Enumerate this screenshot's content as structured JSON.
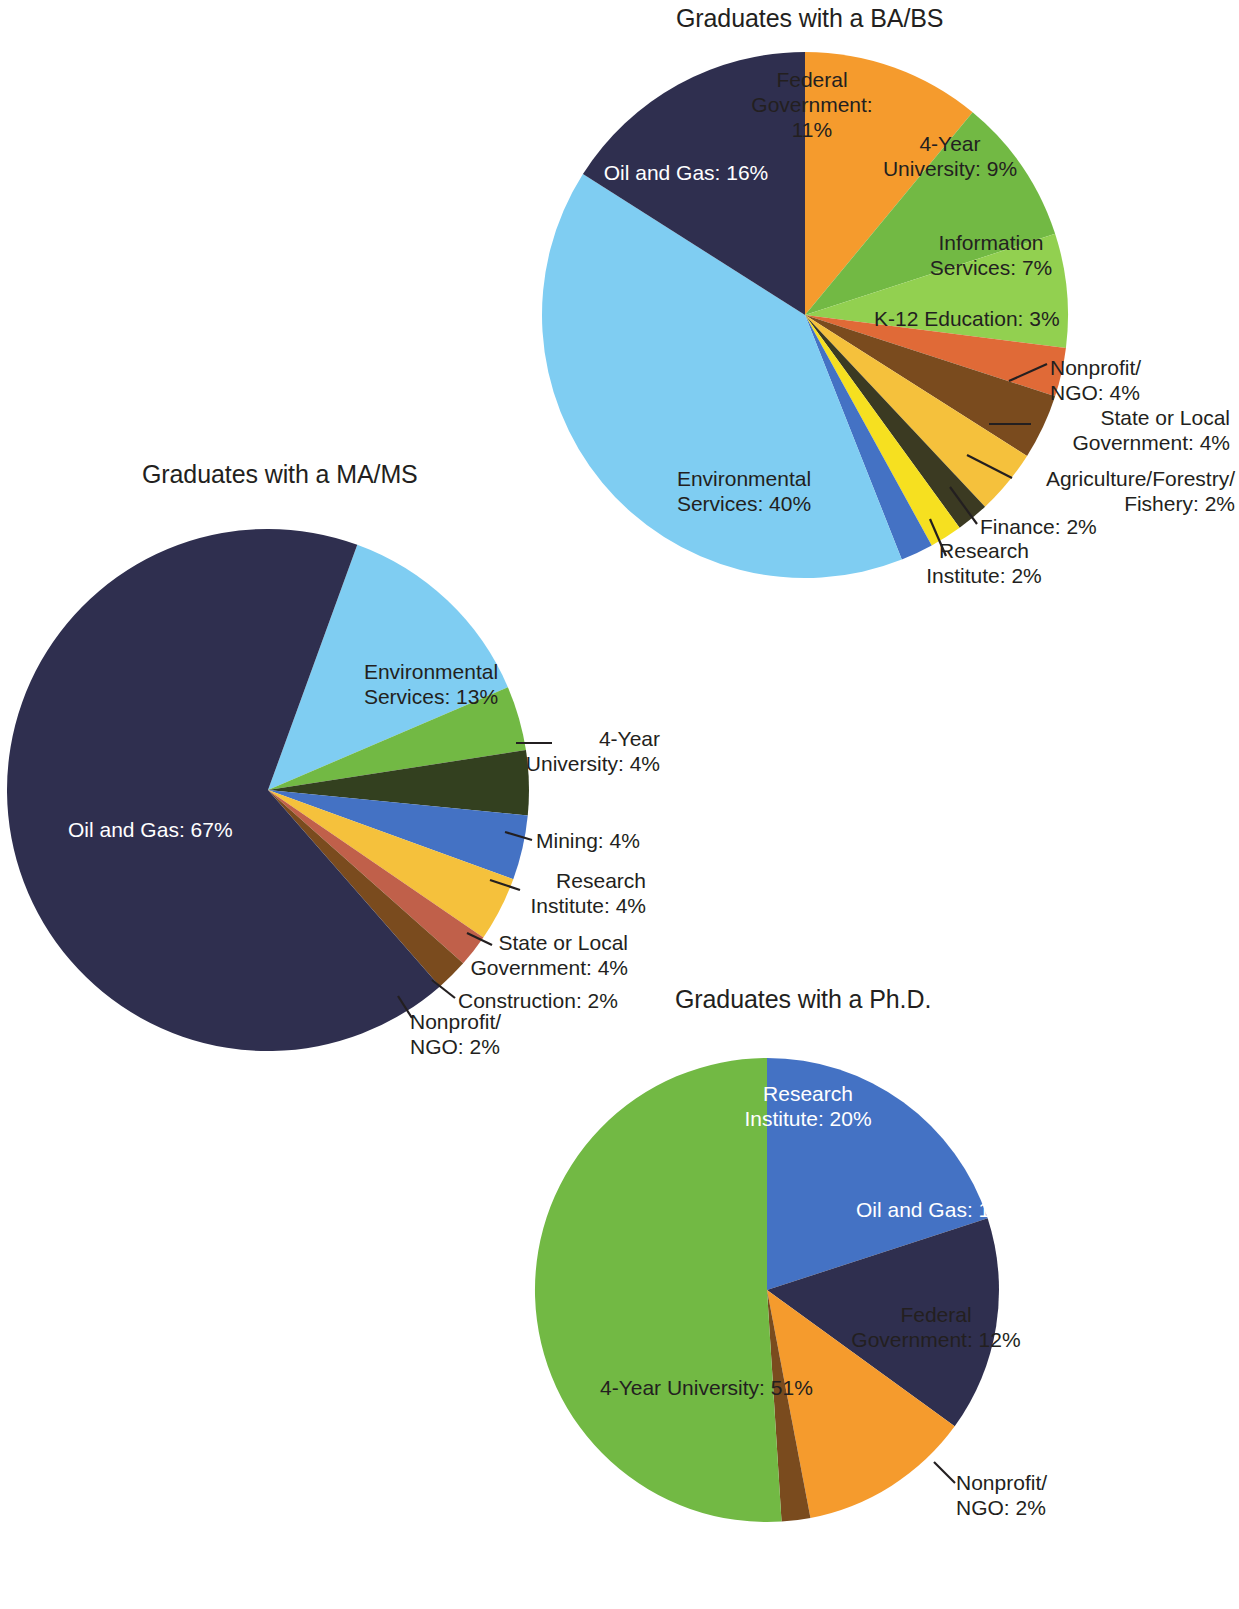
{
  "figure": {
    "background_color": "#ffffff",
    "label_text_color": "#231f20",
    "label_text_color_on_dark": "#ffffff"
  },
  "palette": {
    "oil_and_gas": "#2f2f4f",
    "environmental_services": "#7fcdf2",
    "federal_government": "#f59b2d",
    "four_year_university": "#72b944",
    "information_services": "#92d050",
    "k12_education": "#e06a37",
    "nonprofit_ngo": "#7a4b1e",
    "state_or_local_government": "#f5c13c",
    "agriculture_forestry_fishery": "#3b3a22",
    "finance": "#f6e020",
    "research_institute": "#4472c4",
    "mining": "#33401f",
    "construction": "#c0604a"
  },
  "charts": [
    {
      "id": "ba-bs",
      "type": "pie",
      "title": "Graduates with a BA/BS",
      "categories": [
        "Federal Government",
        "4-Year University",
        "Information Services",
        "K-12 Education",
        "Nonprofit/NGO",
        "State or Local Government",
        "Agriculture/Forestry/Fishery",
        "Finance",
        "Research Institute",
        "Environmental Services",
        "Oil and Gas"
      ],
      "values": [
        11,
        9,
        7,
        3,
        4,
        4,
        2,
        2,
        2,
        40,
        16
      ],
      "slices": [
        {
          "label": "Federal Government",
          "value": 11,
          "display": "Federal\nGovernment:\n11%",
          "color": "#f59b2d"
        },
        {
          "label": "4-Year University",
          "value": 9,
          "display": "4-Year\nUniversity: 9%",
          "color": "#72b944"
        },
        {
          "label": "Information Services",
          "value": 7,
          "display": "Information\nServices: 7%",
          "color": "#92d050"
        },
        {
          "label": "K-12 Education",
          "value": 3,
          "display": "K-12 Education: 3%",
          "color": "#e06a37"
        },
        {
          "label": "Nonprofit/NGO",
          "value": 4,
          "display": "Nonprofit/\nNGO: 4%",
          "color": "#7a4b1e"
        },
        {
          "label": "State or Local Government",
          "value": 4,
          "display": "State or Local\nGovernment: 4%",
          "color": "#f5c13c"
        },
        {
          "label": "Agriculture/Forestry/Fishery",
          "value": 2,
          "display": "Agriculture/Forestry/\nFishery: 2%",
          "color": "#3b3a22"
        },
        {
          "label": "Finance",
          "value": 2,
          "display": "Finance: 2%",
          "color": "#f6e020"
        },
        {
          "label": "Research Institute",
          "value": 2,
          "display": "Research\nInstitute: 2%",
          "color": "#4472c4"
        },
        {
          "label": "Environmental Services",
          "value": 40,
          "display": "Environmental\nServices: 40%",
          "color": "#7fcdf2"
        },
        {
          "label": "Oil and Gas",
          "value": 16,
          "display": "Oil and Gas: 16%",
          "color": "#2f2f4f"
        }
      ]
    },
    {
      "id": "ma-ms",
      "type": "pie",
      "title": "Graduates with a MA/MS",
      "categories": [
        "Environmental Services",
        "4-Year University",
        "Mining",
        "Research Institute",
        "State or Local Government",
        "Construction",
        "Nonprofit/NGO",
        "Oil and Gas"
      ],
      "values": [
        13,
        4,
        4,
        4,
        4,
        2,
        2,
        67
      ],
      "slices": [
        {
          "label": "Environmental Services",
          "value": 13,
          "display": "Environmental\nServices: 13%",
          "color": "#7fcdf2"
        },
        {
          "label": "4-Year University",
          "value": 4,
          "display": "4-Year\nUniversity: 4%",
          "color": "#72b944"
        },
        {
          "label": "Mining",
          "value": 4,
          "display": "Mining: 4%",
          "color": "#33401f"
        },
        {
          "label": "Research Institute",
          "value": 4,
          "display": "Research\nInstitute: 4%",
          "color": "#4472c4"
        },
        {
          "label": "State or Local Government",
          "value": 4,
          "display": "State or Local\nGovernment: 4%",
          "color": "#f5c13c"
        },
        {
          "label": "Construction",
          "value": 2,
          "display": "Construction: 2%",
          "color": "#c0604a"
        },
        {
          "label": "Nonprofit/NGO",
          "value": 2,
          "display": "Nonprofit/\nNGO: 2%",
          "color": "#7a4b1e"
        },
        {
          "label": "Oil and Gas",
          "value": 67,
          "display": "Oil and Gas: 67%",
          "color": "#2f2f4f"
        }
      ]
    },
    {
      "id": "phd",
      "type": "pie",
      "title": "Graduates with a Ph.D.",
      "categories": [
        "Research Institute",
        "Oil and Gas",
        "Federal Government",
        "Nonprofit/NGO",
        "4-Year University"
      ],
      "values": [
        20,
        15,
        12,
        2,
        51
      ],
      "slices": [
        {
          "label": "Research Institute",
          "value": 20,
          "display": "Research\nInstitute: 20%",
          "color": "#4472c4"
        },
        {
          "label": "Oil and Gas",
          "value": 15,
          "display": "Oil and Gas: 15%",
          "color": "#2f2f4f"
        },
        {
          "label": "Federal Government",
          "value": 12,
          "display": "Federal\nGovernment: 12%",
          "color": "#f59b2d"
        },
        {
          "label": "Nonprofit/NGO",
          "value": 2,
          "display": "Nonprofit/\nNGO: 2%",
          "color": "#7a4b1e"
        },
        {
          "label": "4-Year University",
          "value": 51,
          "display": "4-Year University: 51%",
          "color": "#72b944"
        }
      ]
    }
  ],
  "chart_data": [
    {
      "type": "pie",
      "title": "Graduates with a BA/BS",
      "categories": [
        "Federal Government",
        "4-Year University",
        "Information Services",
        "K-12 Education",
        "Nonprofit/NGO",
        "State or Local Government",
        "Agriculture/Forestry/Fishery",
        "Finance",
        "Research Institute",
        "Environmental Services",
        "Oil and Gas"
      ],
      "values": [
        11,
        9,
        7,
        3,
        4,
        4,
        2,
        2,
        2,
        40,
        16
      ],
      "unit": "%",
      "legend": "none",
      "labels": "on-slice and leader-line callouts",
      "start_angle_deg": 0,
      "direction": "clockwise"
    },
    {
      "type": "pie",
      "title": "Graduates with a MA/MS",
      "categories": [
        "Environmental Services",
        "4-Year University",
        "Mining",
        "Research Institute",
        "State or Local Government",
        "Construction",
        "Nonprofit/NGO",
        "Oil and Gas"
      ],
      "values": [
        13,
        4,
        4,
        4,
        4,
        2,
        2,
        67
      ],
      "unit": "%",
      "legend": "none",
      "labels": "on-slice and leader-line callouts",
      "start_angle_deg": 20,
      "direction": "clockwise"
    },
    {
      "type": "pie",
      "title": "Graduates with a Ph.D.",
      "categories": [
        "Research Institute",
        "Oil and Gas",
        "Federal Government",
        "Nonprofit/NGO",
        "4-Year University"
      ],
      "values": [
        20,
        15,
        12,
        2,
        51
      ],
      "unit": "%",
      "legend": "none",
      "labels": "on-slice and leader-line callouts",
      "start_angle_deg": 0,
      "direction": "clockwise"
    }
  ]
}
